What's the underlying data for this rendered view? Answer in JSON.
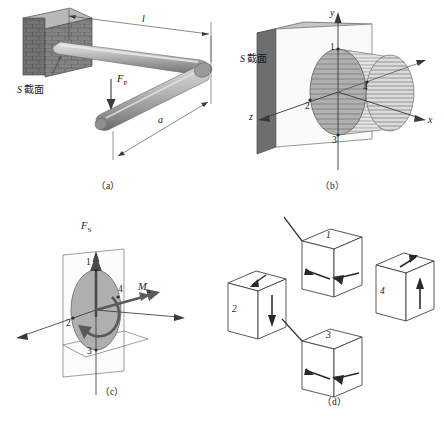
{
  "figure": {
    "captions": {
      "a": "（a）",
      "b": "（b）",
      "c": "（c）",
      "d": "（d）"
    }
  },
  "panel_a": {
    "name": "cantilever-rod-in-wall",
    "labels": {
      "section_label": "S 截面",
      "section_symbol": "S",
      "section_word": "截面",
      "length_l": "l",
      "length_a": "a",
      "force": "F",
      "force_sub": "P"
    }
  },
  "panel_b": {
    "name": "section-s-coordinate-system",
    "labels": {
      "section_label": "S 截面",
      "section_symbol": "S",
      "section_word": "截面",
      "axis_x": "x",
      "axis_y": "y",
      "axis_z": "z",
      "point_1": "1",
      "point_2": "2",
      "point_3": "3",
      "point_4": "4"
    }
  },
  "panel_c": {
    "name": "internal-force-resultants",
    "labels": {
      "shear_force": "F",
      "shear_force_sub": "S",
      "torque_moment": "M",
      "torque_moment_sub": "x",
      "point_1": "1",
      "point_2": "2",
      "point_3": "3",
      "point_4": "4"
    }
  },
  "panel_d": {
    "name": "stress-element-cubes",
    "cubes": [
      {
        "id": "1",
        "label": "1"
      },
      {
        "id": "2",
        "label": "2"
      },
      {
        "id": "3",
        "label": "3"
      },
      {
        "id": "4",
        "label": "4"
      }
    ]
  },
  "colors": {
    "ink": "#1a1a1a",
    "rod_light": "#c9c9c9",
    "rod_mid": "#a6a6a6",
    "rod_dark": "#7d7d7d",
    "brick_face": "#8e8e8e",
    "brick_side": "#5e5e5e",
    "brick_top": "#bdbdbd",
    "plate_face": "#f2f2f2",
    "plate_edge": "#6f6f6f",
    "disk_fill": "#b4b4b4",
    "hatch": "#8c8c8c",
    "outline": "#3a3a3a"
  }
}
